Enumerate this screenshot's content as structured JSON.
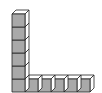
{
  "figure": {
    "vertical_column_cubes": 6,
    "horizontal_row_cubes": 6,
    "total_cubes": 11,
    "colors": {
      "front": "#a9a9a9",
      "top": "#ffffff",
      "side": "#ffffff",
      "stroke": "#222222"
    }
  }
}
